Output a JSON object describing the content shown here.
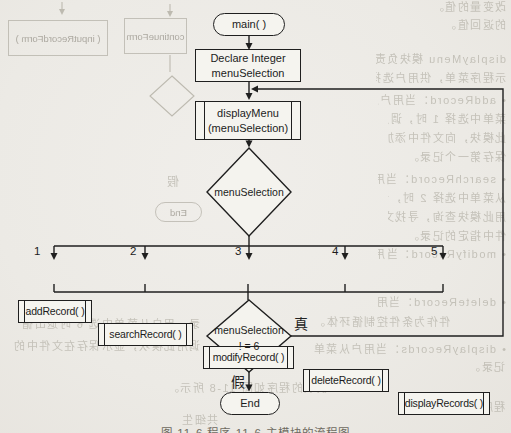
{
  "flowchart": {
    "nodes": {
      "start": "main( )",
      "declare_line1": "Declare Integer",
      "declare_line2": "menuSelection",
      "display_menu_line1": "displayMenu",
      "display_menu_line2": "(menuSelection)",
      "menu_decision": "menuSelection",
      "loop_decision_line1": "menuSelection",
      "loop_decision_line2": "! = 6",
      "end": "End"
    },
    "branches": [
      {
        "number": "1",
        "label": "addRecord( )"
      },
      {
        "number": "2",
        "label": "searchRecord( )"
      },
      {
        "number": "3",
        "label": "modifyRecord( )"
      },
      {
        "number": "4",
        "label": "deleteRecord( )"
      },
      {
        "number": "5",
        "label": "displayRecords( )"
      }
    ],
    "labels": {
      "true_label": "真",
      "false_label": "假"
    }
  },
  "caption": "图 11-6  程序 11-6 主模块的流程图",
  "bleed_through": {
    "top_left_boxes": [
      {
        "text": "( inputRecordForm )"
      },
      {
        "text": "( continueForm )"
      }
    ],
    "end_oval": "End",
    "false_char": "假",
    "fragments": [
      {
        "text": "改变量的值。",
        "x": 388,
        "y": 1,
        "w": 118,
        "size": 11
      },
      {
        "text": "的返回值。",
        "x": 406,
        "y": 19,
        "w": 100,
        "size": 11
      },
      {
        "text": "displayMenu 模块负责显",
        "x": 376,
        "y": 53,
        "w": 130,
        "size": 11
      },
      {
        "text": "示程序菜单，供用户选择。",
        "x": 376,
        "y": 72,
        "w": 130,
        "size": 11
      },
      {
        "text": "• addRecord：当用户从",
        "x": 378,
        "y": 94,
        "w": 128,
        "size": 11
      },
      {
        "text": "菜单中选择 1 时，调用",
        "x": 388,
        "y": 113,
        "w": 118,
        "size": 11
      },
      {
        "text": "此模块，向文件中添加",
        "x": 388,
        "y": 132,
        "w": 118,
        "size": 11
      },
      {
        "text": "保存第一个记录。",
        "x": 388,
        "y": 151,
        "w": 118,
        "size": 11
      },
      {
        "text": "• searchRecord：当用户",
        "x": 378,
        "y": 173,
        "w": 128,
        "size": 11
      },
      {
        "text": "从菜单中选择 2 时，调",
        "x": 388,
        "y": 192,
        "w": 118,
        "size": 11
      },
      {
        "text": "用此模块查询，寻找文",
        "x": 388,
        "y": 211,
        "w": 118,
        "size": 11
      },
      {
        "text": "件中指定的记录。",
        "x": 388,
        "y": 230,
        "w": 118,
        "size": 11
      },
      {
        "text": "• modifyRecord：当用户",
        "x": 378,
        "y": 248,
        "w": 128,
        "size": 11
      },
      {
        "text": "• deleteRecord：当用户从",
        "x": 378,
        "y": 296,
        "w": 128,
        "size": 11
      },
      {
        "text": "• displayRecords：当用户从菜单",
        "x": 312,
        "y": 343,
        "w": 194,
        "size": 11
      },
      {
        "text": "记录。",
        "x": 455,
        "y": 361,
        "w": 50,
        "size": 11
      },
      {
        "text": "录。用户从菜单中选 6 时退出循",
        "x": 0,
        "y": 318,
        "w": 200,
        "size": 11
      },
      {
        "text": "调用此模块，显示保存在文件中的",
        "x": 0,
        "y": 340,
        "w": 200,
        "size": 11
      },
      {
        "text": "件作为条件控制循环体。",
        "x": 302,
        "y": 316,
        "w": 148,
        "size": 11
      },
      {
        "text": "上模块的程序如图 11-8 所示。",
        "x": 112,
        "y": 382,
        "w": 228,
        "size": 11
      },
      {
        "text": "程序 11-6  主模块",
        "x": 385,
        "y": 401,
        "w": 120,
        "size": 11
      },
      {
        "text": "共细生",
        "x": 158,
        "y": 414,
        "w": 60,
        "size": 11
      }
    ]
  }
}
